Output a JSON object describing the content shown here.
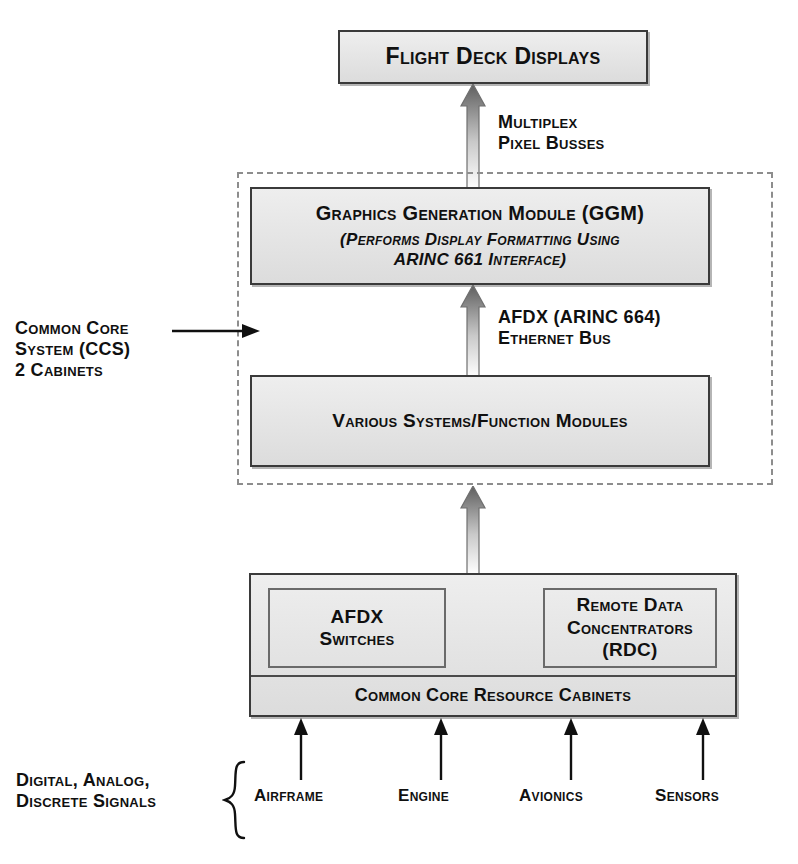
{
  "diagram": {
    "colors": {
      "box_fill": "#e6e6e6",
      "box_border": "#3a3a3a",
      "dashed_border": "#8d8d8d",
      "arrow_dark": "#555555",
      "arrow_light": "#d8d8d8",
      "text": "#101010"
    },
    "nodes": {
      "flight_deck": {
        "label": "Flight Deck Displays"
      },
      "ggm": {
        "label": "Graphics Generation Module (GGM)",
        "sub_line1": "(Performs Display Formatting Using",
        "sub_line2": "ARINC 661 Interface)"
      },
      "various_systems": {
        "label": "Various Systems/Function Modules"
      },
      "afdx_switches": {
        "line1": "AFDX",
        "line2": "Switches"
      },
      "rdc": {
        "line1": "Remote Data",
        "line2": "Concentrators",
        "line3": "(RDC)"
      },
      "common_core_cabinets": {
        "label": "Common Core Resource Cabinets"
      }
    },
    "connections": {
      "multiplex_pixel_busses": {
        "line1": "Multiplex",
        "line2": "Pixel Busses"
      },
      "afdx_ethernet": {
        "line1": "AFDX (ARINC 664)",
        "line2": "Ethernet Bus"
      }
    },
    "annotations": {
      "ccs": {
        "line1": "Common Core",
        "line2": "System (CCS)",
        "line3": "2 Cabinets"
      },
      "signals": {
        "line1": "Digital, Analog,",
        "line2": "Discrete Signals"
      }
    },
    "sources": [
      {
        "label": "Airframe"
      },
      {
        "label": "Engine"
      },
      {
        "label": "Avionics"
      },
      {
        "label": "Sensors"
      }
    ]
  }
}
